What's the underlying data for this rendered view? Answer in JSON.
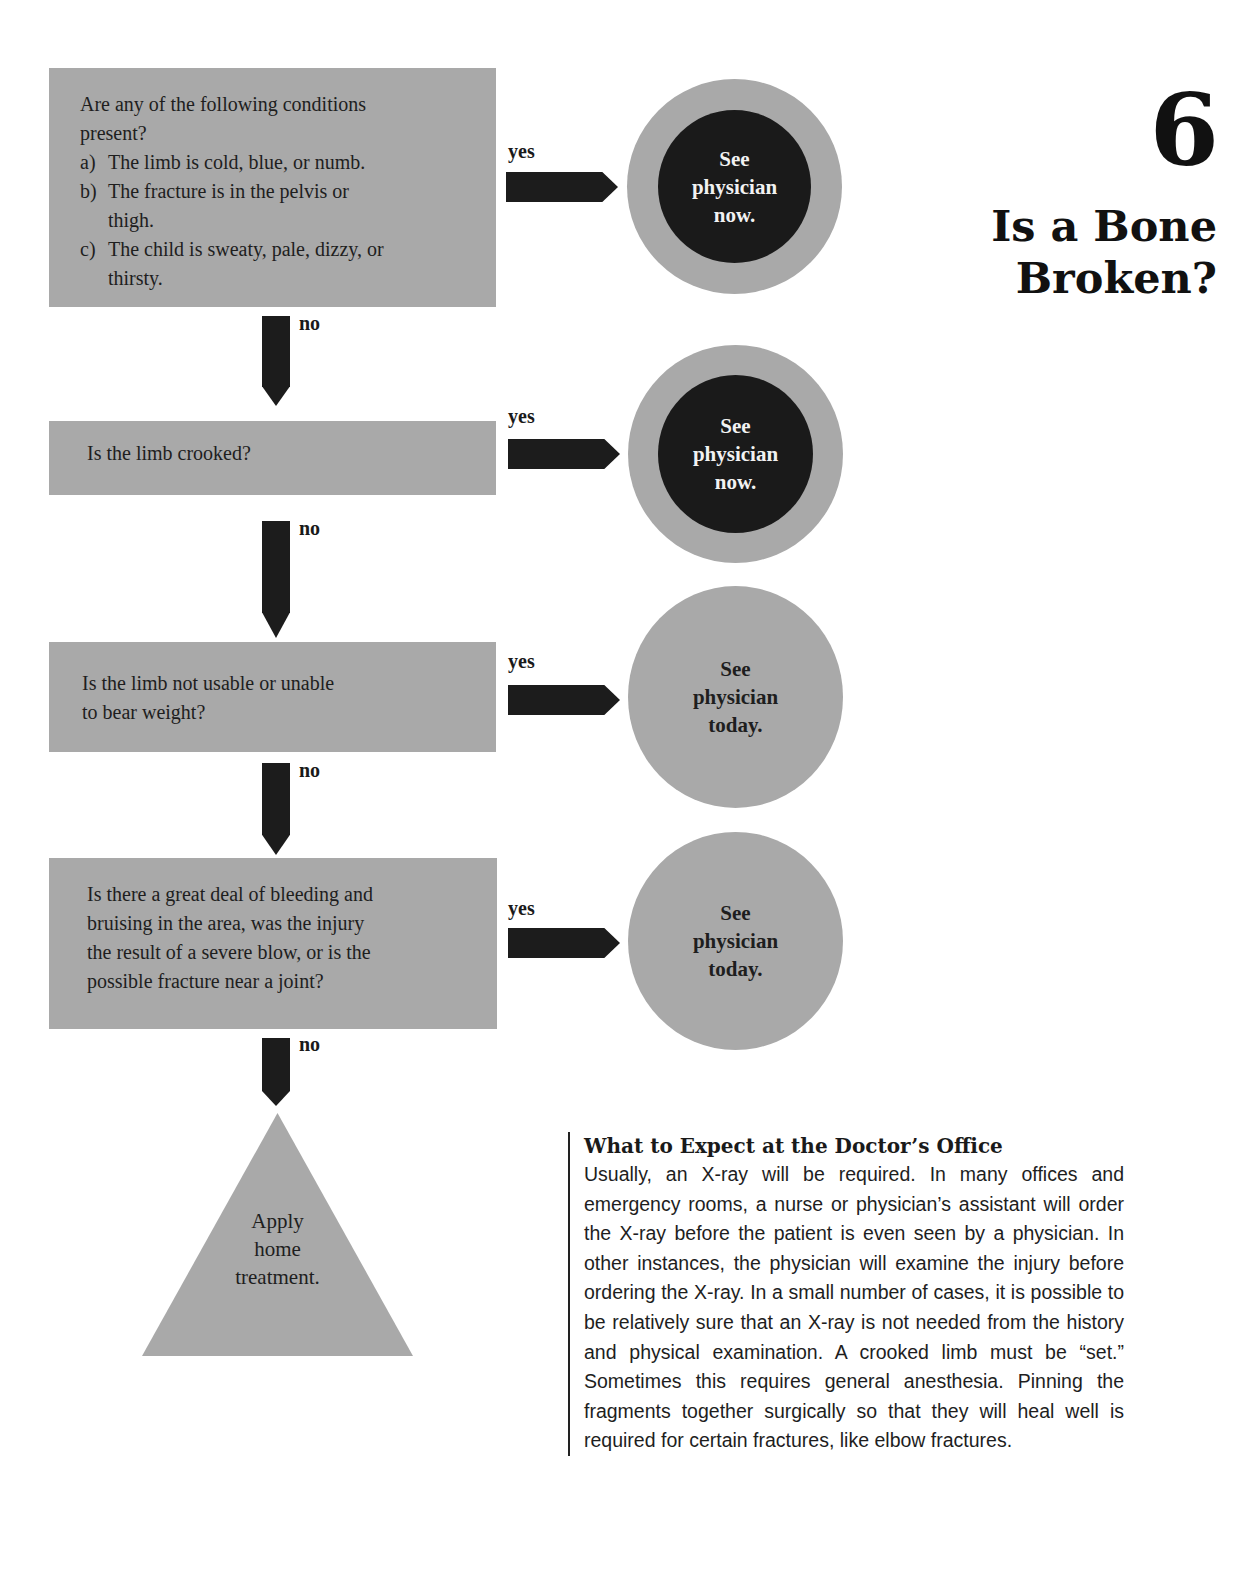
{
  "header": {
    "chapter_number": "6",
    "title_lines": [
      "Is a Bone",
      "Broken?"
    ]
  },
  "flowchart": {
    "questions": [
      {
        "intro_lines": [
          "Are any of the following conditions",
          "present?"
        ],
        "items": [
          {
            "marker": "a)",
            "lines": [
              "The limb is cold, blue, or numb."
            ]
          },
          {
            "marker": "b)",
            "lines": [
              "The fracture is in the pelvis or",
              "thigh."
            ]
          },
          {
            "marker": "c)",
            "lines": [
              "The child is sweaty, pale, dizzy, or",
              "thirsty."
            ]
          }
        ],
        "yes_label": "yes",
        "no_label": "no",
        "outcome": {
          "lines": [
            "See",
            "physician",
            "now."
          ],
          "urgency": "now"
        }
      },
      {
        "lines": [
          "Is the limb crooked?"
        ],
        "yes_label": "yes",
        "no_label": "no",
        "outcome": {
          "lines": [
            "See",
            "physician",
            "now."
          ],
          "urgency": "now"
        }
      },
      {
        "lines": [
          "Is the limb not usable or unable",
          "to bear weight?"
        ],
        "yes_label": "yes",
        "no_label": "no",
        "outcome": {
          "lines": [
            "See",
            "physician",
            "today."
          ],
          "urgency": "today"
        }
      },
      {
        "lines": [
          "Is there a great deal of bleeding and",
          "bruising in the area, was the injury",
          "the result of a severe blow, or is the",
          "possible fracture near a joint?"
        ],
        "yes_label": "yes",
        "no_label": "no",
        "outcome": {
          "lines": [
            "See",
            "physician",
            "today."
          ],
          "urgency": "today"
        }
      }
    ],
    "final_outcome": {
      "lines": [
        "Apply",
        "home",
        "treatment."
      ]
    }
  },
  "sidebar": {
    "heading": "What to Expect at the Doctor’s Office",
    "body": "Usually, an X-ray will be required. In many offices and emergency rooms, a nurse or physician’s assistant will order the X-ray before the patient is even seen by a physician. In other instances, the physician will examine the injury before ordering the X-ray. In a small number of cases, it is possible to be relatively sure that an X-ray is not needed from the history and physical examination. A crooked limb must be “set.” Sometimes this requires general anesthesia. Pinning the fragments together surgically so that they will heal well is required for certain fractures, like elbow fractures."
  },
  "colors": {
    "box_gray": "#a9a9a9",
    "arrow_black": "#1c1c1c",
    "urgent_inner": "#1a1a1a",
    "page_bg": "#ffffff"
  }
}
